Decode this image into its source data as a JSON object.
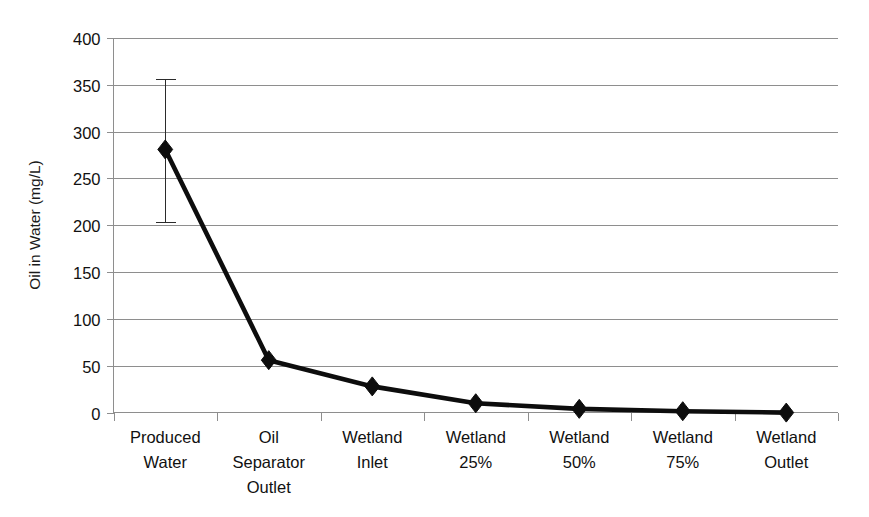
{
  "chart_data": {
    "type": "line",
    "title": "",
    "xlabel": "",
    "ylabel": "Oil in Water (mg/L)",
    "ylim": [
      0,
      400
    ],
    "yticks": [
      0,
      50,
      100,
      150,
      200,
      250,
      300,
      350,
      400
    ],
    "ytick_labels": [
      "0",
      "50",
      "100",
      "150",
      "200",
      "250",
      "300",
      "350",
      "400"
    ],
    "grid": true,
    "legend": "none",
    "marker": "diamond",
    "line_color": "#0d0d0d",
    "grid_color": "#8e8e8e",
    "categories": [
      "Produced Water",
      "Oil Separator Outlet",
      "Wetland Inlet",
      "Wetland 25%",
      "Wetland 50%",
      "Wetland 75%",
      "Wetland Outlet"
    ],
    "category_lines": [
      [
        "Produced",
        "Water"
      ],
      [
        "Oil",
        "Separator",
        "Outlet"
      ],
      [
        "Wetland",
        "Inlet"
      ],
      [
        "Wetland",
        "25%"
      ],
      [
        "Wetland",
        "50%"
      ],
      [
        "Wetland",
        "75%"
      ],
      [
        "Wetland",
        "Outlet"
      ]
    ],
    "values": [
      281,
      56,
      28,
      10,
      4,
      1.5,
      0
    ],
    "error_bars": [
      {
        "category": "Produced Water",
        "low": 204,
        "high": 356
      },
      {
        "category": "Oil Separator Outlet",
        "low": null,
        "high": null
      },
      {
        "category": "Wetland Inlet",
        "low": null,
        "high": null
      },
      {
        "category": "Wetland 25%",
        "low": null,
        "high": null
      },
      {
        "category": "Wetland 50%",
        "low": null,
        "high": null
      },
      {
        "category": "Wetland 75%",
        "low": null,
        "high": null
      },
      {
        "category": "Wetland Outlet",
        "low": null,
        "high": null
      }
    ]
  }
}
